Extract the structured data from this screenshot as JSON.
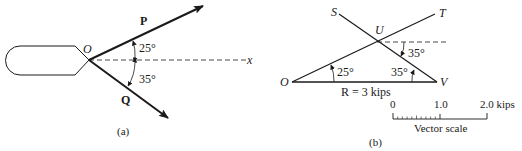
{
  "figure": {
    "panel_a": {
      "caption": "(a)",
      "origin_label": "O",
      "force_p_label": "P",
      "force_q_label": "Q",
      "axis_label": "x",
      "angle_p": "25°",
      "angle_q": "35°"
    },
    "panel_b": {
      "caption": "(b)",
      "point_o": "O",
      "point_v": "V",
      "point_u": "U",
      "point_s": "S",
      "point_t": "T",
      "angle_at_o": "25°",
      "angle_at_v": "35°",
      "angle_at_u": "35°",
      "resultant_label": "R = 3 kips",
      "scale": {
        "tick_0": "0",
        "tick_1": "1.0",
        "tick_2": "2.0 kips",
        "title": "Vector scale"
      }
    }
  },
  "colors": {
    "ink": "#1a1a1a",
    "background": "#ffffff"
  }
}
